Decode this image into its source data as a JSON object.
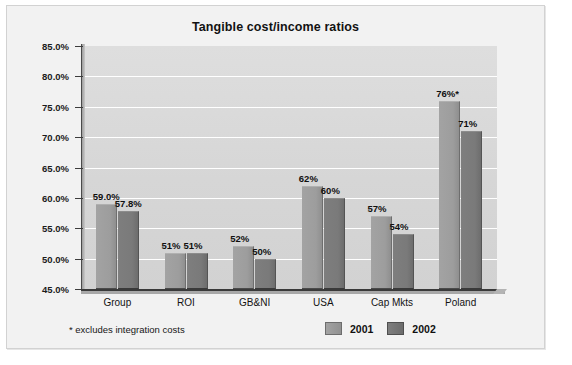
{
  "chart_data": {
    "type": "bar",
    "title": "Tangible cost/income ratios",
    "xlabel": "",
    "ylabel": "",
    "ylim": [
      45.0,
      85.0
    ],
    "ytick_step": 5.0,
    "ytick_labels": [
      "85.0%",
      "80.0%",
      "75.0%",
      "70.0%",
      "65.0%",
      "60.0%",
      "55.0%",
      "50.0%",
      "45.0%"
    ],
    "ytick_values": [
      85.0,
      80.0,
      75.0,
      70.0,
      65.0,
      60.0,
      55.0,
      50.0,
      45.0
    ],
    "grid": true,
    "grid_color": "#ffffff",
    "plot_background": "#d9d9d9",
    "legend_position": "bottom-right",
    "categories": [
      "Group",
      "ROI",
      "GB&NI",
      "USA",
      "Cap Mkts",
      "Poland"
    ],
    "series": [
      {
        "name": "2001",
        "color": "#9d9d9d",
        "values": [
          59.0,
          51.0,
          52.0,
          62.0,
          57.0,
          76.0
        ],
        "labels": [
          "59.0%",
          "51%",
          "52%",
          "62%",
          "57%",
          "76%*"
        ]
      },
      {
        "name": "2002",
        "color": "#7a7a7a",
        "values": [
          57.8,
          51.0,
          50.0,
          60.0,
          54.0,
          71.0
        ],
        "labels": [
          "57.8%",
          "51%",
          "50%",
          "60%",
          "54%",
          "71%"
        ]
      }
    ],
    "annotations": [
      "* excludes integration costs"
    ]
  },
  "footnote": "* excludes integration costs",
  "legend": {
    "items": [
      {
        "label": "2001"
      },
      {
        "label": "2002"
      }
    ]
  }
}
